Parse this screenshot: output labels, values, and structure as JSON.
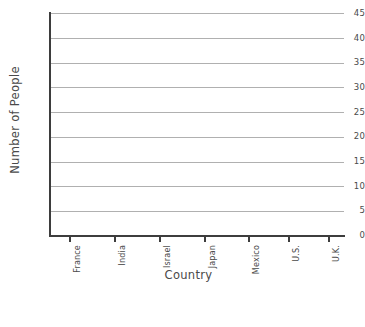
{
  "chart_data": {
    "type": "bar",
    "title": "",
    "xlabel": "Country",
    "ylabel": "Number of People",
    "categories": [
      "France",
      "India",
      "Israel",
      "Japan",
      "Mexico",
      "U.S.",
      "U.K."
    ],
    "values": [
      0,
      0,
      0,
      0,
      0,
      0,
      0
    ],
    "series": [
      {
        "name": "Number of People",
        "values": [
          0,
          0,
          0,
          0,
          0,
          0,
          0
        ]
      }
    ],
    "ylim": [
      0,
      45
    ],
    "ytick_step": 5,
    "yticks": [
      0,
      5,
      10,
      15,
      20,
      25,
      30,
      35,
      40,
      45
    ],
    "ytick_labels": [
      "0",
      "5",
      "10",
      "15",
      "20",
      "25",
      "30",
      "35",
      "40",
      "45"
    ],
    "grid": true,
    "grid_axis": "y",
    "legend": false,
    "legend_position": "none",
    "note": "Empty grid template: no bars are plotted",
    "colors": {
      "background": "#ffffff",
      "gridline": "#b0b0b0",
      "axis": "#3d3d3d",
      "text": "#4a4a4a"
    }
  }
}
